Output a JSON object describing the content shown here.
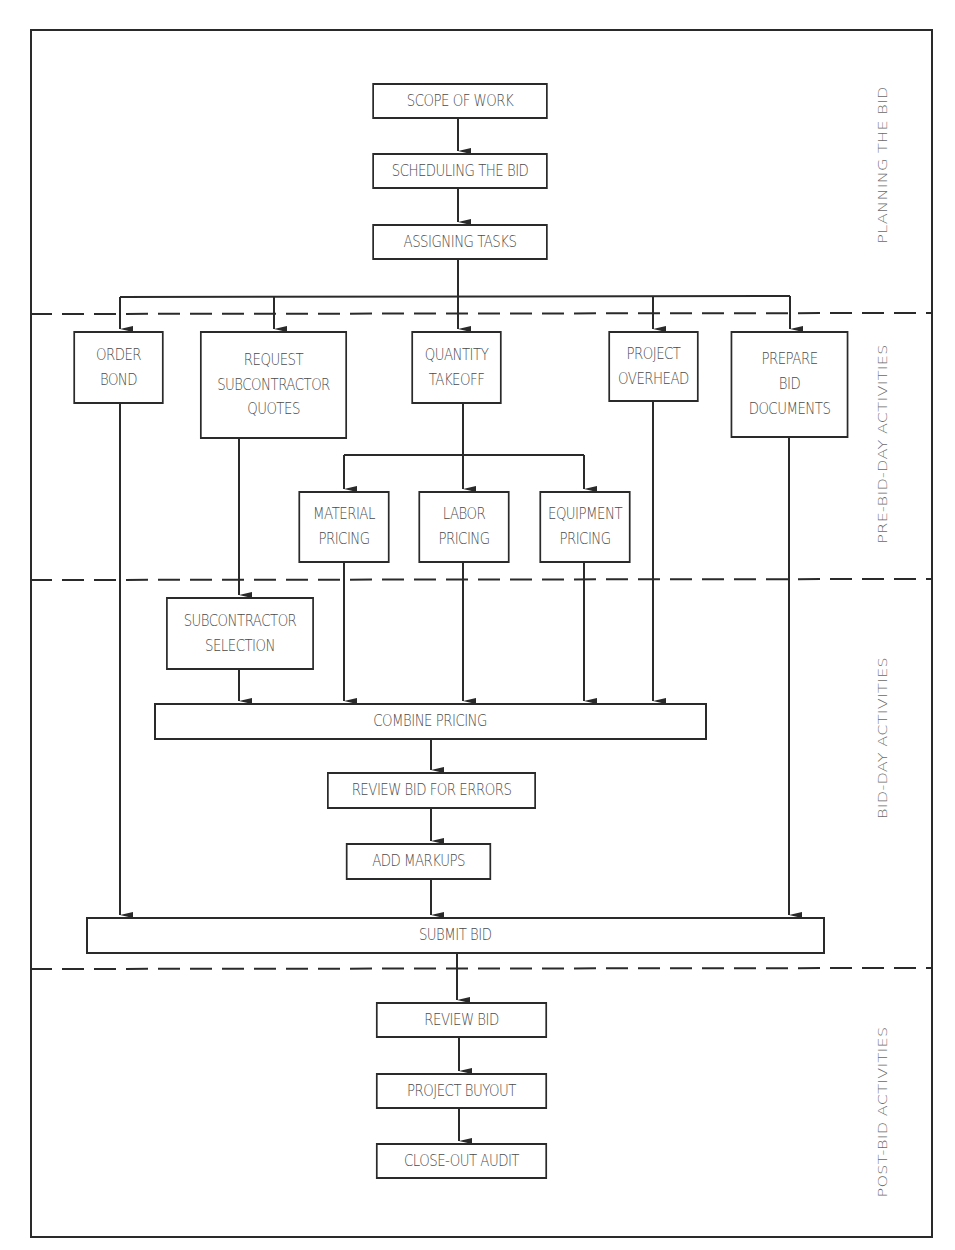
{
  "diagram": {
    "phases": [
      {
        "id": "planning",
        "label": "PLANNING THE BID"
      },
      {
        "id": "pre_bid_day",
        "label": "PRE-BID-DAY ACTIVITIES"
      },
      {
        "id": "bid_day",
        "label": "BID-DAY ACTIVITIES"
      },
      {
        "id": "post_bid",
        "label": "POST-BID ACTIVITIES"
      }
    ],
    "nodes": {
      "scope_of_work": "SCOPE OF WORK",
      "scheduling_the_bid": "SCHEDULING THE BID",
      "assigning_tasks": "ASSIGNING TASKS",
      "order_bond": "ORDER\nBOND",
      "request_subcontractor_quotes": "REQUEST\nSUBCONTRACTOR\nQUOTES",
      "quantity_takeoff": "QUANTITY\nTAKEOFF",
      "project_overhead": "PROJECT\nOVERHEAD",
      "prepare_bid_documents": "PREPARE\nBID\nDOCUMENTS",
      "material_pricing": "MATERIAL\nPRICING",
      "labor_pricing": "LABOR\nPRICING",
      "equipment_pricing": "EQUIPMENT\nPRICING",
      "subcontractor_selection": "SUBCONTRACTOR\nSELECTION",
      "combine_pricing": "COMBINE PRICING",
      "review_bid_for_errors": "REVIEW BID FOR ERRORS",
      "add_markups": "ADD MARKUPS",
      "submit_bid": "SUBMIT BID",
      "review_bid": "REVIEW BID",
      "project_buyout": "PROJECT BUYOUT",
      "close_out_audit": "CLOSE-OUT AUDIT"
    },
    "edges": [
      [
        "scope_of_work",
        "scheduling_the_bid"
      ],
      [
        "scheduling_the_bid",
        "assigning_tasks"
      ],
      [
        "assigning_tasks",
        "order_bond"
      ],
      [
        "assigning_tasks",
        "request_subcontractor_quotes"
      ],
      [
        "assigning_tasks",
        "quantity_takeoff"
      ],
      [
        "assigning_tasks",
        "project_overhead"
      ],
      [
        "assigning_tasks",
        "prepare_bid_documents"
      ],
      [
        "quantity_takeoff",
        "material_pricing"
      ],
      [
        "quantity_takeoff",
        "labor_pricing"
      ],
      [
        "quantity_takeoff",
        "equipment_pricing"
      ],
      [
        "request_subcontractor_quotes",
        "subcontractor_selection"
      ],
      [
        "subcontractor_selection",
        "combine_pricing"
      ],
      [
        "material_pricing",
        "combine_pricing"
      ],
      [
        "labor_pricing",
        "combine_pricing"
      ],
      [
        "equipment_pricing",
        "combine_pricing"
      ],
      [
        "project_overhead",
        "combine_pricing"
      ],
      [
        "combine_pricing",
        "review_bid_for_errors"
      ],
      [
        "review_bid_for_errors",
        "add_markups"
      ],
      [
        "add_markups",
        "submit_bid"
      ],
      [
        "order_bond",
        "submit_bid"
      ],
      [
        "prepare_bid_documents",
        "submit_bid"
      ],
      [
        "submit_bid",
        "review_bid"
      ],
      [
        "review_bid",
        "project_buyout"
      ],
      [
        "project_buyout",
        "close_out_audit"
      ]
    ],
    "colors": {
      "line": "#2a2a2a",
      "text": "#4a4a4a",
      "phase_text": "#6a6a6a",
      "background": "#ffffff"
    }
  }
}
